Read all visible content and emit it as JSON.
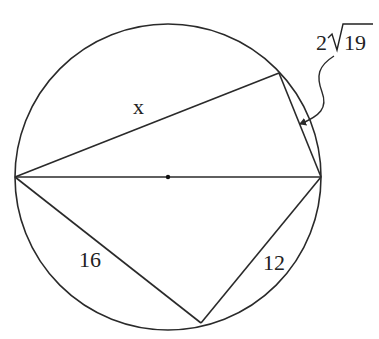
{
  "diagram": {
    "type": "geometry",
    "stroke_color": "#2a2a2a",
    "background": "#ffffff",
    "circle": {
      "cx": 168,
      "cy": 177,
      "r": 153
    },
    "points": {
      "left": {
        "x": 15,
        "y": 177
      },
      "right": {
        "x": 321,
        "y": 177
      },
      "top": {
        "x": 279,
        "y": 73
      },
      "bottom": {
        "x": 201,
        "y": 323
      },
      "center": {
        "x": 168,
        "y": 177
      }
    },
    "labels": {
      "x": "x",
      "side_top_right_coef": "2",
      "side_top_right_radicand": "19",
      "side_bottom_left": "16",
      "side_bottom_right": "12"
    }
  }
}
